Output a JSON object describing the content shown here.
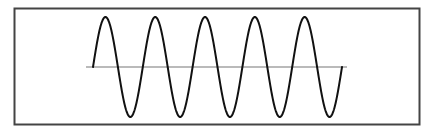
{
  "diagram": {
    "type": "sine-wave",
    "cycles": 5,
    "frame": {
      "x": 14.5,
      "y": 8.5,
      "width": 405,
      "height": 116,
      "stroke": "#444444",
      "stroke_width": 2
    },
    "baseline": {
      "x1": 86,
      "x2": 347,
      "y": 67,
      "stroke": "#777777",
      "stroke_width": 1.2
    },
    "wave": {
      "x_start": 93,
      "x_end": 342,
      "center_y": 67,
      "amplitude": 50,
      "stroke": "#111111",
      "stroke_width": 2
    }
  }
}
